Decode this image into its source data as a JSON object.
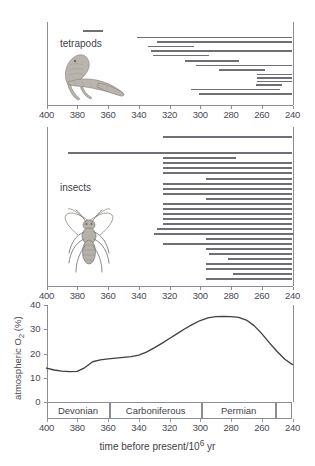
{
  "figure": {
    "axis": {
      "x_min_value": 400,
      "x_max_value": 240,
      "x_ticks": [
        400,
        380,
        360,
        340,
        320,
        300,
        280,
        260,
        240
      ],
      "x_caption": "time before present/10⁶ yr",
      "direction": "reversed"
    },
    "panels": [
      {
        "name": "tetrapods",
        "label": "tetrapods",
        "icon": "tetrapod-silhouette",
        "bars": [
          {
            "start": 376,
            "end": 363
          },
          {
            "start": 341,
            "end": 240
          },
          {
            "start": 328,
            "end": 240
          },
          {
            "start": 334,
            "end": 304
          },
          {
            "start": 332,
            "end": 240
          },
          {
            "start": 331,
            "end": 294
          },
          {
            "start": 310,
            "end": 275
          },
          {
            "start": 303,
            "end": 240
          },
          {
            "start": 288,
            "end": 258
          },
          {
            "start": 263,
            "end": 240
          },
          {
            "start": 263,
            "end": 240
          },
          {
            "start": 263,
            "end": 240
          },
          {
            "start": 264,
            "end": 247
          },
          {
            "start": 306,
            "end": 248
          },
          {
            "start": 301,
            "end": 240
          }
        ]
      },
      {
        "name": "insects",
        "label": "insects",
        "icon": "insect-silhouette",
        "bars": [
          {
            "start": 324,
            "end": 240
          },
          {
            "start": 386,
            "end": 240
          },
          {
            "start": 324,
            "end": 277
          },
          {
            "start": 324,
            "end": 240
          },
          {
            "start": 324,
            "end": 240
          },
          {
            "start": 324,
            "end": 240
          },
          {
            "start": 296,
            "end": 240
          },
          {
            "start": 324,
            "end": 240
          },
          {
            "start": 324,
            "end": 240
          },
          {
            "start": 324,
            "end": 240
          },
          {
            "start": 296,
            "end": 240
          },
          {
            "start": 324,
            "end": 240
          },
          {
            "start": 324,
            "end": 240
          },
          {
            "start": 324,
            "end": 240
          },
          {
            "start": 324,
            "end": 240
          },
          {
            "start": 324,
            "end": 240
          },
          {
            "start": 328,
            "end": 240
          },
          {
            "start": 330,
            "end": 240
          },
          {
            "start": 296,
            "end": 240
          },
          {
            "start": 324,
            "end": 240
          },
          {
            "start": 296,
            "end": 240
          },
          {
            "start": 294,
            "end": 240
          },
          {
            "start": 282,
            "end": 240
          },
          {
            "start": 296,
            "end": 240
          },
          {
            "start": 296,
            "end": 240
          },
          {
            "start": 279,
            "end": 240
          },
          {
            "start": 296,
            "end": 240
          }
        ]
      }
    ]
  },
  "chart_data": {
    "type": "line",
    "title": "",
    "xlabel": "time before present/10⁶ yr",
    "ylabel": "atmospheric O₂ (%)",
    "xlim": [
      400,
      240
    ],
    "ylim": [
      0,
      40
    ],
    "x_ticks": [
      400,
      380,
      360,
      340,
      320,
      300,
      280,
      260,
      240
    ],
    "y_ticks": [
      0,
      10,
      20,
      30,
      40
    ],
    "grid": false,
    "legend": "none",
    "x": [
      400,
      395,
      390,
      385,
      380,
      375,
      370,
      365,
      360,
      355,
      350,
      345,
      340,
      335,
      330,
      325,
      320,
      315,
      310,
      305,
      300,
      295,
      290,
      285,
      280,
      275,
      270,
      265,
      260,
      255,
      250,
      245,
      240
    ],
    "values": [
      14.0,
      13.2,
      12.7,
      12.5,
      12.6,
      14.2,
      16.6,
      17.4,
      17.8,
      18.1,
      18.4,
      18.7,
      19.3,
      20.6,
      22.3,
      24.2,
      26.2,
      28.2,
      30.2,
      32.0,
      33.6,
      34.7,
      35.2,
      35.3,
      35.2,
      34.9,
      33.8,
      31.5,
      28.2,
      24.4,
      20.8,
      17.6,
      15.4
    ],
    "series_name": "atmospheric O₂"
  },
  "periods": [
    {
      "label": "Devonian",
      "start": 400,
      "end": 359
    },
    {
      "label": "Carboniferous",
      "start": 359,
      "end": 299
    },
    {
      "label": "Permian",
      "start": 299,
      "end": 251
    },
    {
      "label": "",
      "start": 251,
      "end": 240
    }
  ]
}
